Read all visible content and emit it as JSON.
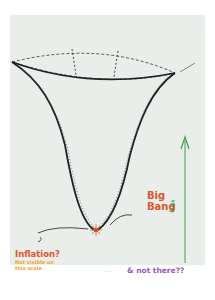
{
  "diagram": {
    "type": "hand-drawn cosmology sketch",
    "shape": "funnel / trumpet representing expansion of the universe",
    "labels": {
      "big_bang_line1": "Big",
      "big_bang_line2": "Bang",
      "inflation": "Inflation?",
      "inflation_note_line1": "Not visible on",
      "inflation_note_line2": "this scale",
      "not_there": "& not there??",
      "time_axis": "time",
      "dots": "....."
    },
    "colors": {
      "paper": "#e9eeeb",
      "funnel_ink": "#222222",
      "big_bang": "#e3532c",
      "inflation": "#e0552e",
      "note": "#efa62c",
      "not_there": "#9a5ab5",
      "time_arrow": "#3aa24a"
    }
  }
}
